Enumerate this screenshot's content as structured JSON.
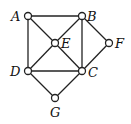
{
  "diagram": {
    "type": "graph",
    "nodes": [
      {
        "id": "A",
        "label": "A",
        "x": 28,
        "y": 16,
        "lx": 11,
        "ly": 21
      },
      {
        "id": "B",
        "label": "B",
        "x": 82,
        "y": 16,
        "lx": 87,
        "ly": 21
      },
      {
        "id": "E",
        "label": "E",
        "x": 55,
        "y": 43,
        "lx": 61,
        "ly": 48
      },
      {
        "id": "F",
        "label": "F",
        "x": 109,
        "y": 43,
        "lx": 115,
        "ly": 48
      },
      {
        "id": "D",
        "label": "D",
        "x": 28,
        "y": 71,
        "lx": 10,
        "ly": 76
      },
      {
        "id": "C",
        "label": "C",
        "x": 82,
        "y": 71,
        "lx": 88,
        "ly": 77
      },
      {
        "id": "G",
        "label": "G",
        "x": 55,
        "y": 98,
        "lx": 50,
        "ly": 117
      }
    ],
    "edges": [
      [
        "A",
        "B"
      ],
      [
        "A",
        "D"
      ],
      [
        "A",
        "E"
      ],
      [
        "E",
        "C"
      ],
      [
        "B",
        "E"
      ],
      [
        "E",
        "D"
      ],
      [
        "B",
        "C"
      ],
      [
        "B",
        "F"
      ],
      [
        "F",
        "C"
      ],
      [
        "D",
        "C"
      ],
      [
        "D",
        "G"
      ],
      [
        "G",
        "C"
      ]
    ],
    "colors": {
      "stroke": "#222222",
      "node_fill": "#ffffff"
    }
  }
}
